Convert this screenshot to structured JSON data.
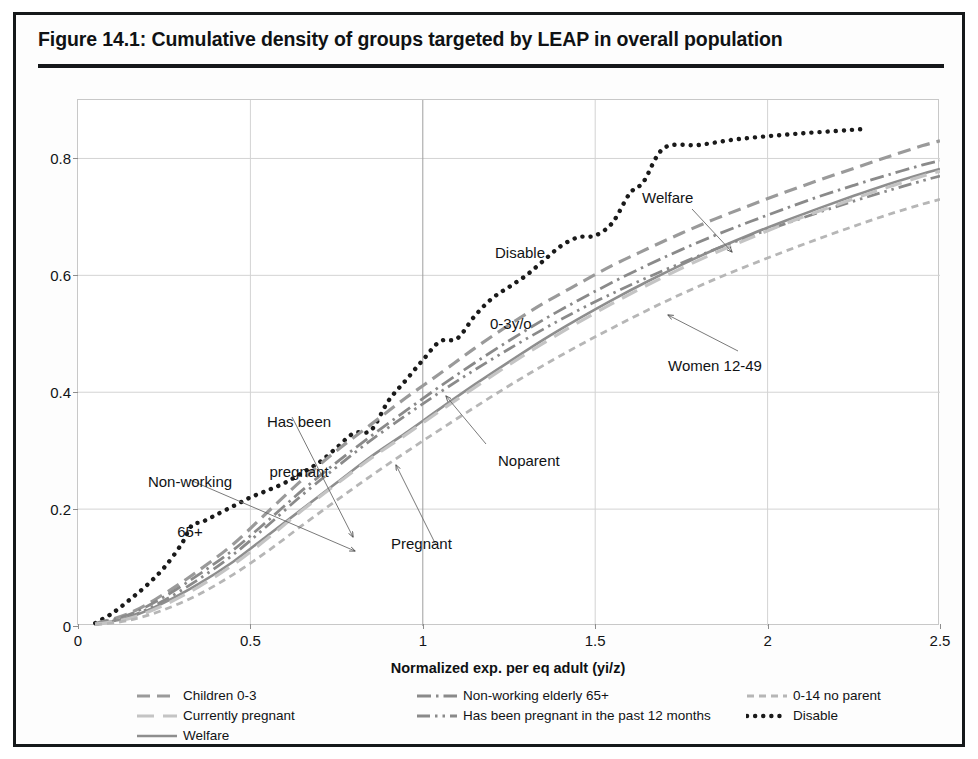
{
  "figure": {
    "title": "Figure 14.1:  Cumulative density of groups targeted by LEAP in overall population"
  },
  "axes": {
    "x_title": "Normalized exp. per eq adult (yi/z)",
    "x_ticks": [
      "0",
      "0.5",
      "1",
      "1.5",
      "2",
      "2.5"
    ],
    "y_ticks": [
      "0",
      "0.2",
      "0.4",
      "0.6",
      "0.8"
    ]
  },
  "annotations": [
    {
      "id": "non-working-65",
      "line1": "Non-working",
      "line2": "65+"
    },
    {
      "id": "has-been-pregnant",
      "line1": "Has been",
      "line2": "pregnant"
    },
    {
      "id": "pregnant",
      "line1": "Pregnant",
      "line2": ""
    },
    {
      "id": "disable",
      "line1": "Disable",
      "line2": ""
    },
    {
      "id": "welfare",
      "line1": "Welfare",
      "line2": ""
    },
    {
      "id": "zero-three-yo",
      "line1": "0-3y/o",
      "line2": ""
    },
    {
      "id": "noparent",
      "line1": "Noparent",
      "line2": ""
    },
    {
      "id": "women-12-49",
      "line1": "Women 12-49",
      "line2": ""
    }
  ],
  "legend": [
    {
      "label": "Children 0-3",
      "style": "dashed",
      "color": "#9a9a9a",
      "col": 0,
      "row": 0
    },
    {
      "label": "Currently pregnant",
      "style": "longdash",
      "color": "#c4c4c4",
      "col": 0,
      "row": 1
    },
    {
      "label": "Welfare",
      "style": "solid",
      "color": "#8e8e8e",
      "col": 0,
      "row": 2
    },
    {
      "label": "Non-working elderly 65+",
      "style": "dashdot",
      "color": "#8a8a8a",
      "col": 1,
      "row": 0
    },
    {
      "label": "Has been pregnant in the past 12 months",
      "style": "dashdot2",
      "color": "#8a8a8a",
      "col": 1,
      "row": 1
    },
    {
      "label": "0-14 no parent",
      "style": "shortdash",
      "color": "#b6b6b6",
      "col": 2,
      "row": 0
    },
    {
      "label": "Disable",
      "style": "dotted",
      "color": "#1a1a1a",
      "col": 2,
      "row": 1
    }
  ],
  "colors": {
    "frame": "#15181a",
    "grid": "#d3d3d3",
    "text": "#111315",
    "disable": "#1a1a1a",
    "welfare": "#8e8e8e",
    "children": "#9a9a9a",
    "pregnant": "#c4c4c4",
    "elderly": "#8a8a8a",
    "hasbeen": "#8a8a8a",
    "noparent": "#b6b6b6"
  },
  "chart_data": {
    "type": "line",
    "title": "Figure 14.1:  Cumulative density of groups targeted by LEAP in overall population",
    "xlabel": "Normalized exp. per eq adult (yi/z)",
    "ylabel": "",
    "xlim": [
      0,
      2.5
    ],
    "ylim": [
      0,
      0.9
    ],
    "xticks": [
      0,
      0.5,
      1,
      1.5,
      2,
      2.5
    ],
    "yticks": [
      0,
      0.2,
      0.4,
      0.6,
      0.8
    ],
    "grid": true,
    "legend_position": "below",
    "series": [
      {
        "name": "Disable",
        "style": "dotted",
        "color": "#1a1a1a",
        "x": [
          0.05,
          0.1,
          0.15,
          0.2,
          0.25,
          0.3,
          0.33,
          0.36,
          0.4,
          0.45,
          0.5,
          0.55,
          0.6,
          0.65,
          0.7,
          0.75,
          0.8,
          0.85,
          0.9,
          0.95,
          1.0,
          1.05,
          1.1,
          1.15,
          1.2,
          1.25,
          1.3,
          1.35,
          1.4,
          1.45,
          1.5,
          1.55,
          1.6,
          1.64,
          1.7,
          1.8,
          1.9,
          2.0,
          2.1,
          2.2,
          2.27
        ],
        "y": [
          0.005,
          0.022,
          0.045,
          0.07,
          0.1,
          0.14,
          0.172,
          0.178,
          0.19,
          0.205,
          0.22,
          0.232,
          0.245,
          0.262,
          0.28,
          0.305,
          0.33,
          0.335,
          0.385,
          0.42,
          0.455,
          0.487,
          0.492,
          0.53,
          0.56,
          0.58,
          0.6,
          0.625,
          0.65,
          0.665,
          0.668,
          0.69,
          0.74,
          0.76,
          0.818,
          0.823,
          0.832,
          0.838,
          0.843,
          0.847,
          0.85
        ]
      },
      {
        "name": "Children 0-3",
        "style": "dashed",
        "color": "#9a9a9a",
        "x": [
          0.05,
          0.15,
          0.25,
          0.35,
          0.45,
          0.55,
          0.65,
          0.75,
          0.85,
          0.95,
          1.05,
          1.15,
          1.25,
          1.35,
          1.45,
          1.55,
          1.65,
          1.75,
          1.85,
          1.95,
          2.05,
          2.15,
          2.25,
          2.35,
          2.45,
          2.5
        ],
        "y": [
          0.004,
          0.022,
          0.055,
          0.095,
          0.14,
          0.195,
          0.25,
          0.3,
          0.345,
          0.39,
          0.432,
          0.475,
          0.515,
          0.552,
          0.585,
          0.617,
          0.645,
          0.672,
          0.697,
          0.72,
          0.742,
          0.763,
          0.783,
          0.803,
          0.822,
          0.83
        ]
      },
      {
        "name": "Welfare",
        "style": "solid",
        "color": "#8e8e8e",
        "x": [
          0.05,
          0.15,
          0.25,
          0.35,
          0.45,
          0.55,
          0.65,
          0.75,
          0.85,
          0.95,
          1.05,
          1.15,
          1.25,
          1.35,
          1.45,
          1.55,
          1.65,
          1.75,
          1.85,
          1.95,
          2.05,
          2.15,
          2.25,
          2.35,
          2.45,
          2.5
        ],
        "y": [
          0.003,
          0.015,
          0.04,
          0.072,
          0.11,
          0.155,
          0.2,
          0.245,
          0.29,
          0.33,
          0.372,
          0.413,
          0.452,
          0.49,
          0.525,
          0.558,
          0.589,
          0.618,
          0.645,
          0.67,
          0.693,
          0.715,
          0.736,
          0.756,
          0.774,
          0.782
        ]
      },
      {
        "name": "Non-working elderly 65+",
        "style": "dashdot",
        "color": "#8a8a8a",
        "x": [
          0.05,
          0.15,
          0.25,
          0.35,
          0.45,
          0.55,
          0.65,
          0.75,
          0.85,
          0.95,
          1.05,
          1.15,
          1.25,
          1.35,
          1.45,
          1.55,
          1.65,
          1.75,
          1.85,
          1.95,
          2.05,
          2.15,
          2.25,
          2.35,
          2.45,
          2.5
        ],
        "y": [
          0.004,
          0.02,
          0.05,
          0.088,
          0.13,
          0.18,
          0.232,
          0.28,
          0.325,
          0.368,
          0.41,
          0.45,
          0.488,
          0.524,
          0.557,
          0.588,
          0.617,
          0.644,
          0.669,
          0.692,
          0.714,
          0.735,
          0.754,
          0.772,
          0.789,
          0.796
        ]
      },
      {
        "name": "Has been pregnant in the past 12 months",
        "style": "dashdot2",
        "color": "#8a8a8a",
        "x": [
          0.05,
          0.15,
          0.25,
          0.35,
          0.45,
          0.55,
          0.65,
          0.75,
          0.85,
          0.95,
          1.05,
          1.15,
          1.25,
          1.35,
          1.45,
          1.55,
          1.65,
          1.75,
          1.85,
          1.95,
          2.05,
          2.15,
          2.25,
          2.35,
          2.45,
          2.5
        ],
        "y": [
          0.003,
          0.016,
          0.044,
          0.08,
          0.122,
          0.172,
          0.224,
          0.272,
          0.318,
          0.36,
          0.4,
          0.438,
          0.474,
          0.508,
          0.54,
          0.569,
          0.596,
          0.621,
          0.645,
          0.667,
          0.688,
          0.708,
          0.727,
          0.745,
          0.762,
          0.77
        ]
      },
      {
        "name": "Currently pregnant",
        "style": "longdash",
        "color": "#c4c4c4",
        "x": [
          0.05,
          0.15,
          0.25,
          0.35,
          0.45,
          0.55,
          0.65,
          0.75,
          0.85,
          0.95,
          1.05,
          1.15,
          1.25,
          1.35,
          1.45,
          1.55,
          1.65,
          1.75,
          1.85,
          1.95,
          2.05,
          2.15,
          2.25,
          2.35,
          2.45,
          2.5
        ],
        "y": [
          0.003,
          0.013,
          0.036,
          0.067,
          0.105,
          0.15,
          0.198,
          0.243,
          0.287,
          0.327,
          0.368,
          0.408,
          0.447,
          0.484,
          0.519,
          0.552,
          0.583,
          0.612,
          0.639,
          0.664,
          0.688,
          0.71,
          0.731,
          0.751,
          0.77,
          0.778
        ]
      },
      {
        "name": "0-14 no parent",
        "style": "shortdash",
        "color": "#b6b6b6",
        "x": [
          0.05,
          0.15,
          0.25,
          0.35,
          0.45,
          0.55,
          0.65,
          0.75,
          0.85,
          0.95,
          1.05,
          1.15,
          1.25,
          1.35,
          1.45,
          1.55,
          1.65,
          1.75,
          1.85,
          1.95,
          2.05,
          2.15,
          2.25,
          2.35,
          2.45,
          2.5
        ],
        "y": [
          0.002,
          0.01,
          0.028,
          0.054,
          0.088,
          0.128,
          0.172,
          0.215,
          0.257,
          0.297,
          0.336,
          0.374,
          0.411,
          0.446,
          0.479,
          0.51,
          0.54,
          0.568,
          0.594,
          0.618,
          0.641,
          0.663,
          0.684,
          0.704,
          0.722,
          0.73
        ]
      }
    ]
  }
}
